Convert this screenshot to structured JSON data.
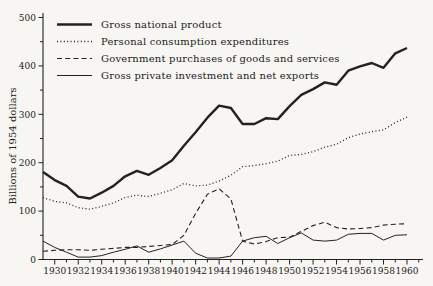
{
  "figure": {
    "background_color": "#f7f6f2",
    "ink_color": "#222222"
  },
  "chart_data": {
    "type": "line",
    "title": "",
    "xlabel": "",
    "ylabel": "Billions of 1954 dollars",
    "x_unit": "year",
    "xlim": [
      1929,
      1961
    ],
    "ylim": [
      0,
      500
    ],
    "grid": false,
    "legend_position": "top-left-inside",
    "y_major_ticks": [
      0,
      100,
      200,
      300,
      400,
      500
    ],
    "y_minor_tick_step": 50,
    "x_labeled_ticks": [
      1930,
      1932,
      1934,
      1936,
      1938,
      1940,
      1942,
      1944,
      1946,
      1948,
      1950,
      1952,
      1954,
      1956,
      1958,
      1960
    ],
    "x_minor_tick_step": 1,
    "x": [
      1929,
      1930,
      1931,
      1932,
      1933,
      1934,
      1935,
      1936,
      1937,
      1938,
      1939,
      1940,
      1941,
      1942,
      1943,
      1944,
      1945,
      1946,
      1947,
      1948,
      1949,
      1950,
      1951,
      1952,
      1953,
      1954,
      1955,
      1956,
      1957,
      1958,
      1959,
      1960
    ],
    "series": [
      {
        "name": "Gross national product",
        "line_style": "solid-thick",
        "values": [
          181,
          164,
          152,
          130,
          126,
          138,
          152,
          172,
          183,
          175,
          189,
          205,
          235,
          263,
          293,
          318,
          313,
          280,
          280,
          292,
          290,
          317,
          340,
          352,
          366,
          361,
          390,
          399,
          406,
          396,
          426,
          437
        ]
      },
      {
        "name": "Personal consumption expenditures",
        "line_style": "dotted",
        "values": [
          128,
          120,
          117,
          107,
          104,
          110,
          117,
          128,
          133,
          130,
          137,
          144,
          157,
          152,
          154,
          162,
          174,
          192,
          194,
          198,
          203,
          215,
          217,
          223,
          232,
          238,
          252,
          259,
          264,
          268,
          283,
          294
        ]
      },
      {
        "name": "Government purchases of goods and services",
        "line_style": "dashed",
        "values": [
          17,
          19,
          20,
          20,
          19,
          21,
          23,
          25,
          25,
          27,
          29,
          31,
          50,
          95,
          135,
          146,
          125,
          38,
          32,
          37,
          45,
          46,
          58,
          70,
          77,
          66,
          63,
          64,
          66,
          71,
          73,
          74
        ]
      },
      {
        "name": "Gross private investment and net exports",
        "line_style": "solid-thin",
        "values": [
          38,
          25,
          15,
          5,
          5,
          8,
          15,
          21,
          28,
          15,
          22,
          30,
          38,
          13,
          3,
          3,
          7,
          38,
          45,
          48,
          33,
          45,
          55,
          40,
          38,
          40,
          52,
          54,
          54,
          40,
          50,
          51
        ]
      }
    ]
  }
}
